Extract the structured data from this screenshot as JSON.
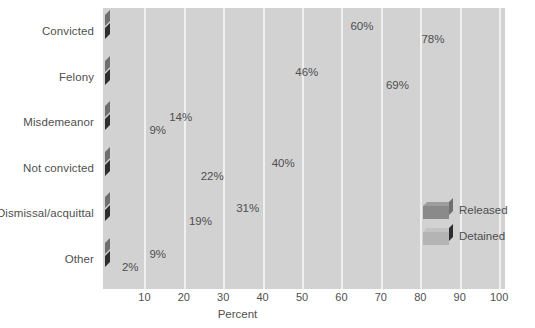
{
  "chart_data": {
    "type": "bar",
    "orientation": "horizontal",
    "title": "",
    "xlabel": "Percent",
    "ylabel": "",
    "xlim": [
      0,
      100
    ],
    "xticks": [
      10,
      20,
      30,
      40,
      50,
      60,
      70,
      80,
      90,
      100
    ],
    "grid": true,
    "legend_position": "inside-right",
    "categories": [
      "Convicted",
      "Felony",
      "Misdemeanor",
      "Not convicted",
      "Dismissal/acquittal",
      "Other"
    ],
    "series": [
      {
        "name": "Released",
        "color": "#8a8a8a",
        "values": [
          60,
          46,
          14,
          40,
          31,
          9
        ],
        "labels": [
          "60%",
          "46%",
          "14%",
          "40%",
          "31%",
          "9%"
        ]
      },
      {
        "name": "Detained",
        "color": "#b4b4b4",
        "values": [
          78,
          69,
          9,
          22,
          19,
          2
        ],
        "labels": [
          "78%",
          "69%",
          "9%",
          "22%",
          "19%",
          "2%"
        ]
      }
    ]
  },
  "axis": {
    "tick_labels": [
      "10",
      "20",
      "30",
      "40",
      "50",
      "60",
      "70",
      "80",
      "90",
      "100"
    ],
    "x_axis_title": "Percent"
  },
  "legend": {
    "items": [
      {
        "label": "Released",
        "color": "#8a8a8a"
      },
      {
        "label": "Detained",
        "color": "#b4b4b4"
      }
    ]
  },
  "colors": {
    "plot_background": "#d2d2d2",
    "gridline": "#f0f0f0",
    "page_background": "#ffffff",
    "text": "#4f4f4f",
    "released_face": "#8a8a8a",
    "released_top": "#9d9d9d",
    "released_side": "#6f6f6f",
    "detained_face": "#b4b4b4",
    "detained_top": "#c3c3c3",
    "detained_side": "#2e2e2e"
  }
}
